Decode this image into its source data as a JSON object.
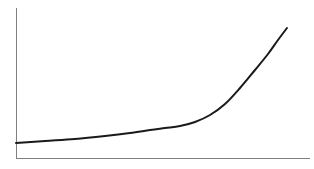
{
  "figure": {
    "width": 314,
    "height": 169,
    "background_color": "#ffffff",
    "title": "",
    "caption": ""
  },
  "style": {
    "axis_color": "#808080",
    "axis_stroke_width": 1,
    "curve_color": "#1a1a1a",
    "curve_stroke_width": 2
  },
  "axes": {
    "y_axis": {
      "x": 16,
      "y_top": 8,
      "y_bottom": 158,
      "label": "",
      "ticks": [],
      "tick_labels": []
    },
    "x_axis": {
      "y": 158,
      "x_left": 16,
      "x_right": 310,
      "label": "",
      "ticks": [],
      "tick_labels": []
    }
  },
  "chart_data": {
    "type": "line",
    "title": "",
    "subtitle": "",
    "xlabel": "",
    "ylabel": "",
    "grid": false,
    "legend": false,
    "legend_position": "none",
    "annotations": [],
    "xlim": [
      0,
      1
    ],
    "ylim": [
      0,
      1
    ],
    "xticks": [],
    "yticks": [],
    "xtick_labels": [],
    "ytick_labels": [],
    "series": [
      {
        "name": "exponential-growth-curve",
        "color": "#1a1a1a",
        "x": [
          0.0,
          0.1,
          0.2,
          0.3,
          0.4,
          0.5,
          0.55,
          0.6,
          0.65,
          0.7,
          0.75,
          0.8,
          0.85,
          0.9,
          0.95,
          1.0
        ],
        "y": [
          0.1,
          0.12,
          0.14,
          0.16,
          0.18,
          0.21,
          0.23,
          0.26,
          0.3,
          0.35,
          0.42,
          0.51,
          0.62,
          0.74,
          0.86,
          0.95
        ],
        "pixel_points": [
          [
            16,
            143
          ],
          [
            45,
            141
          ],
          [
            75,
            139
          ],
          [
            105,
            136
          ],
          [
            130,
            133
          ],
          [
            150,
            130
          ],
          [
            165,
            128
          ],
          [
            180,
            126
          ],
          [
            195,
            122
          ],
          [
            210,
            115
          ],
          [
            225,
            104
          ],
          [
            240,
            88
          ],
          [
            255,
            70
          ],
          [
            268,
            54
          ],
          [
            278,
            40
          ],
          [
            287,
            28
          ]
        ]
      }
    ]
  },
  "accessibility": {
    "figure_role": "Exponential growth line chart with unlabeled axes",
    "curve_description": "A smooth curve that is nearly flat on the left, begins to bend upward near the middle, and rises steeply toward the upper right."
  }
}
